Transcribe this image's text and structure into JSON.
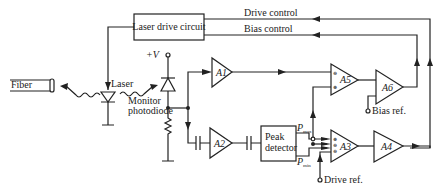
{
  "diagram": {
    "blocks": {
      "laser_drive": "Laser drive circuit",
      "peak_detector_line1": "Peak",
      "peak_detector_line2": "detector"
    },
    "amplifiers": {
      "a1": "A1",
      "a2": "A2",
      "a3": "A3",
      "a4": "A4",
      "a5": "A5",
      "a6": "A6"
    },
    "labels": {
      "fiber": "Fiber",
      "laser": "Laser",
      "monitor_line1": "Monitor",
      "monitor_line2": "photodiode",
      "vplus": "+V",
      "drive_control": "Drive control",
      "bias_control": "Bias control",
      "bias_ref": "Bias ref.",
      "drive_ref": "Drive ref.",
      "pmax": "P",
      "pmax_sub": "max",
      "pmin": "P",
      "pmin_sub": "min"
    }
  }
}
